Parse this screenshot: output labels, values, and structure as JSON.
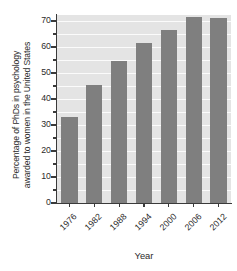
{
  "chart_data": {
    "type": "bar",
    "title": "",
    "xlabel": "Year",
    "ylabel_lines": [
      "Percentage of PhDs in psychology",
      "awarded to women in the United States"
    ],
    "ylabel": "Percentage of PhDs in psychology awarded to women in the United States",
    "categories": [
      "1976",
      "1982",
      "1988",
      "1994",
      "2000",
      "2006",
      "2012"
    ],
    "values": [
      33,
      45.5,
      54.5,
      61.5,
      66.5,
      71.5,
      71
    ],
    "ylim": [
      0,
      72.3
    ],
    "ytick_values": [
      0,
      10,
      20,
      30,
      40,
      50,
      60,
      70
    ],
    "ytick_labels": [
      "0",
      "10",
      "20",
      "30",
      "40",
      "50",
      "60",
      "70"
    ],
    "yminor_tick_values": [
      5,
      15,
      25,
      35,
      45,
      55,
      65
    ],
    "gridline_values": [
      5,
      10,
      15,
      20,
      25,
      30,
      35,
      40,
      45,
      50,
      55,
      60,
      65,
      70
    ],
    "grid": true,
    "grid_axis": "y",
    "legend": false,
    "bar_color": "#7f7f7f",
    "plot_background": "#e4e4e4",
    "gridline_color": "#fbfbfb",
    "axis_color": "#3a3a3a",
    "figure_background": "#ffffff",
    "xtick_label_rotation": 45
  }
}
